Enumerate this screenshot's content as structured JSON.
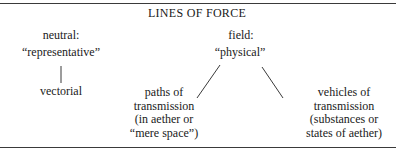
{
  "diagram": {
    "title": "LINES OF FORCE",
    "left_branch": {
      "category": "neutral:",
      "term": "“representative”",
      "child": "vectorial"
    },
    "right_branch": {
      "category": "field:",
      "term": "“physical”",
      "children": [
        {
          "lines": [
            "paths of",
            "transmission",
            "(in aether or",
            "“mere space”)"
          ]
        },
        {
          "lines": [
            "vehicles of",
            "transmission",
            "(substances or",
            "states of aether)"
          ]
        }
      ]
    },
    "colors": {
      "text": "#1a1a1a",
      "lines": "#3a3a3a",
      "background": "#ffffff"
    }
  }
}
